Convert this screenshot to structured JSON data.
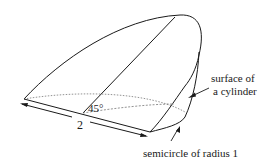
{
  "diagram": {
    "labels": {
      "length": "2",
      "angle": "45°",
      "surface_line1": "surface of",
      "surface_line2": "a cylinder",
      "semicircle": "semicircle of radius 1"
    },
    "colors": {
      "stroke": "#1a1a1a",
      "dotted": "#777777",
      "background": "#ffffff"
    }
  }
}
